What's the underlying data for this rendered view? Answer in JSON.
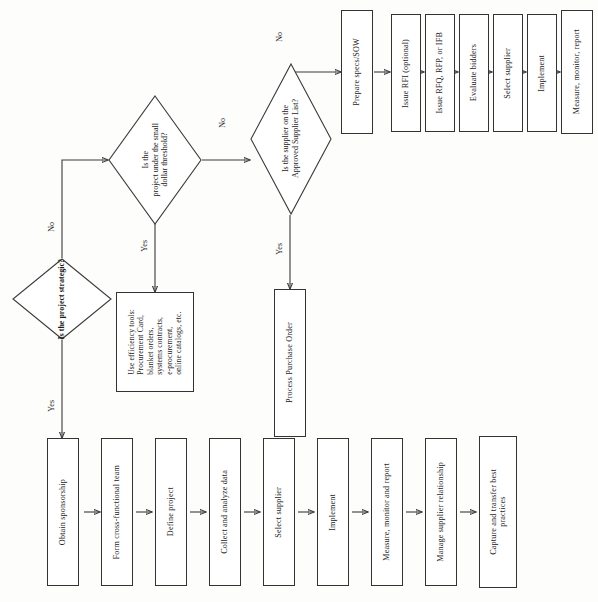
{
  "page": {
    "orientation": "rotated-90-counterclockwise",
    "width": 598,
    "height": 602,
    "background_color": "#fdfdfc",
    "line_color": "#3a3a3a",
    "text_color": "#1a1a1a"
  },
  "decisions": [
    {
      "id": "strategic",
      "label": "Is the project strategic?",
      "emphasis": "bold",
      "yes_label": "Yes",
      "no_label": "No"
    },
    {
      "id": "threshold",
      "label": "Is the\nproject under the small\ndollar threshold?",
      "emphasis": "normal",
      "yes_label": "Yes",
      "no_label": "No"
    },
    {
      "id": "approved_supplier",
      "label": "Is the supplier on the\nApproved Supplier List?",
      "emphasis": "normal",
      "yes_label": "Yes",
      "no_label": "No"
    }
  ],
  "notes": [
    {
      "id": "efficiency_tools",
      "label": "Use efficiency tools:\nProcurement Card,\nblanket orders,\nsystems contracts,\ne-procurement,\nonline catalogs, etc."
    }
  ],
  "purchase_path": [
    {
      "id": "process_po",
      "label": "Process Purchase Order"
    }
  ],
  "bid_path": {
    "title": "Competitive bid branch",
    "steps": [
      {
        "id": "prepare_specs",
        "label": "Prepare specs/SOW"
      },
      {
        "id": "issue_rfi",
        "label": "Issue RFI (optional)"
      },
      {
        "id": "issue_rfq",
        "label": "Issue RFQ, RFP, or IFB"
      },
      {
        "id": "evaluate_bidders",
        "label": "Evaluate bidders"
      },
      {
        "id": "select_supplier_bid",
        "label": "Select supplier"
      },
      {
        "id": "implement_bid",
        "label": "Implement"
      },
      {
        "id": "measure_bid",
        "label": "Measure, monitor, report"
      }
    ]
  },
  "strategic_path": {
    "title": "Strategic sourcing branch",
    "steps": [
      {
        "id": "obtain_sponsorship",
        "label": "Obtain sponsorship"
      },
      {
        "id": "form_team",
        "label": "Form cross-functional team"
      },
      {
        "id": "define_project",
        "label": "Define project"
      },
      {
        "id": "collect_data",
        "label": "Collect and analyze data"
      },
      {
        "id": "select_supplier",
        "label": "Select supplier"
      },
      {
        "id": "implement",
        "label": "Implement"
      },
      {
        "id": "measure_report",
        "label": "Measure, monitor and report"
      },
      {
        "id": "manage_relationship",
        "label": "Manage supplier relationship"
      },
      {
        "id": "capture_practices",
        "label": "Capture and transfer best\npractices"
      }
    ]
  },
  "edge_labels": {
    "strategic_yes": "Yes",
    "strategic_no": "No",
    "threshold_yes": "Yes",
    "threshold_no": "No",
    "supplier_yes": "Yes",
    "supplier_no": "No"
  }
}
